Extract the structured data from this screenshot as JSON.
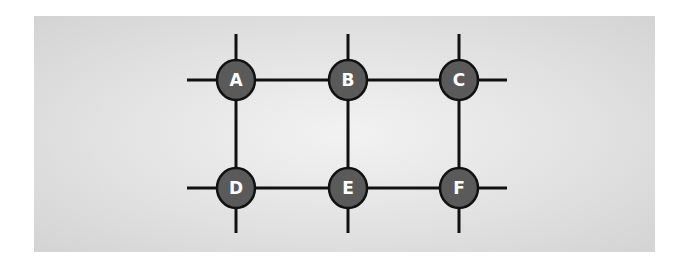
{
  "diagram": {
    "type": "grid-network",
    "background_color": "#dcdcdc",
    "node_fill": "#5a5a5a",
    "edge_color": "#111111",
    "nodes": [
      {
        "id": "A",
        "label": "A",
        "x": 236,
        "y": 80
      },
      {
        "id": "B",
        "label": "B",
        "x": 348,
        "y": 80
      },
      {
        "id": "C",
        "label": "C",
        "x": 459,
        "y": 80
      },
      {
        "id": "D",
        "label": "D",
        "x": 236,
        "y": 188
      },
      {
        "id": "E",
        "label": "E",
        "x": 348,
        "y": 188
      },
      {
        "id": "F",
        "label": "F",
        "x": 459,
        "y": 188
      }
    ],
    "edges": [
      [
        "A",
        "B"
      ],
      [
        "B",
        "C"
      ],
      [
        "D",
        "E"
      ],
      [
        "E",
        "F"
      ],
      [
        "A",
        "D"
      ],
      [
        "B",
        "E"
      ],
      [
        "C",
        "F"
      ]
    ]
  }
}
